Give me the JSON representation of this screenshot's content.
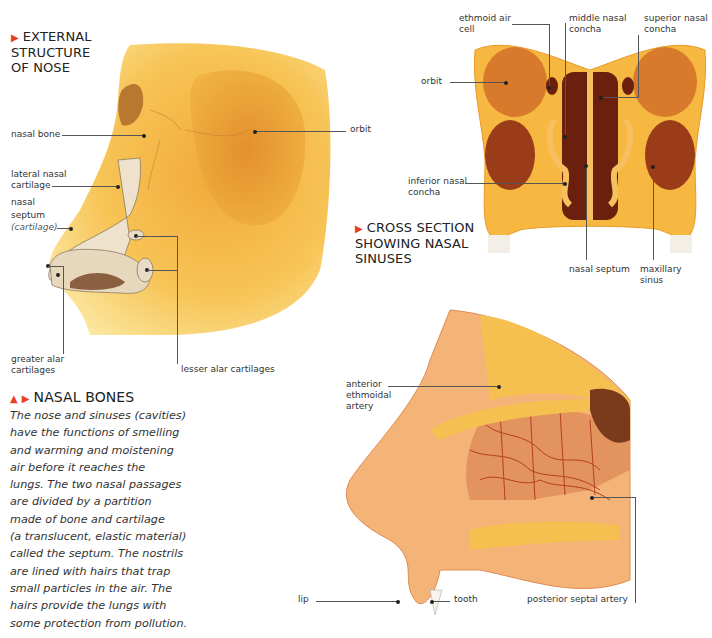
{
  "external_structure": {
    "title_lines": [
      "EXTERNAL",
      "STRUCTURE",
      "OF NOSE"
    ],
    "labels": {
      "nasal_bone": "nasal bone",
      "orbit": "orbit",
      "lateral_nasal_cartilage_1": "lateral nasal",
      "lateral_nasal_cartilage_2": "cartilage",
      "nasal_septum_1": "nasal",
      "nasal_septum_2": "septum",
      "nasal_septum_3": "(cartilage)",
      "greater_alar_1": "greater alar",
      "greater_alar_2": "cartilages",
      "lesser_alar": "lesser alar cartilages"
    }
  },
  "cross_section": {
    "title_lines": [
      "CROSS SECTION",
      "SHOWING NASAL",
      "SINUSES"
    ],
    "labels": {
      "ethmoid_1": "ethmoid air",
      "ethmoid_2": "cell",
      "middle_1": "middle nasal",
      "middle_2": "concha",
      "superior_1": "superior nasal",
      "superior_2": "concha",
      "orbit": "orbit",
      "inferior_1": "inferior nasal",
      "inferior_2": "concha",
      "nasal_septum": "nasal septum",
      "maxillary_1": "maxillary",
      "maxillary_2": "sinus"
    }
  },
  "nasal_bones": {
    "title": "NASAL BONES",
    "text_lines": [
      "The nose and sinuses (cavities)",
      "have the functions of smelling",
      "and warming and moistening",
      "air before it reaches the",
      "lungs. The two nasal passages",
      "are divided by a partition",
      "made of bone and cartilage",
      "(a translucent, elastic material)",
      "called the septum. The nostrils",
      "are lined with hairs that trap",
      "small particles in the air. The",
      "hairs provide the lungs with",
      "some protection from pollution."
    ]
  },
  "sagittal": {
    "labels": {
      "anterior_1": "anterior",
      "anterior_2": "ethmoidal",
      "anterior_3": "artery",
      "lip": "lip",
      "tooth": "tooth",
      "posterior_septal_artery": "posterior septal artery"
    }
  },
  "colors": {
    "accent": "#e8401c",
    "bone": "#f5b53a",
    "bone_light": "#fbd36a",
    "cavity": "#7a2a10",
    "cartilage": "#e8d8c0",
    "tissue": "#f0a070",
    "artery": "#b0301a"
  }
}
